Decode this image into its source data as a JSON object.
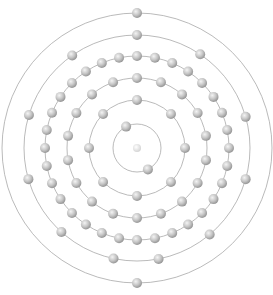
{
  "diagram": {
    "type": "bohr-model",
    "element_configuration": [
      2,
      8,
      18,
      32,
      11,
      2
    ],
    "total_electrons": 73,
    "colors": {
      "background": "#ffffff",
      "orbit": "#a8a8a8",
      "electron_light": "#f4f4f4",
      "electron_mid": "#c4c4c4",
      "electron_dark": "#8e8e8e",
      "nucleus_light": "#ffffff",
      "nucleus_dark": "#cfcfcf"
    },
    "center": {
      "x": 137,
      "y": 148
    },
    "nucleus": {
      "radius": 4
    },
    "electron_radius": 5,
    "shells": [
      {
        "name": "shell-1",
        "radius": 24,
        "electrons": 2,
        "start_angle": -27,
        "angles": null
      },
      {
        "name": "shell-2",
        "radius": 48,
        "electrons": 8,
        "start_angle": 0,
        "angles": null
      },
      {
        "name": "shell-3",
        "radius": 70,
        "electrons": 18,
        "start_angle": 0,
        "angles": null
      },
      {
        "name": "shell-4",
        "radius": 92,
        "electrons": 32,
        "start_angle": 0,
        "angles": null
      },
      {
        "name": "shell-5",
        "radius": 113,
        "electrons": 11,
        "start_angle": 0,
        "angles": [
          0,
          34,
          74,
          106,
          140,
          169,
          192,
          222,
          254,
          287,
          325
        ]
      },
      {
        "name": "shell-6",
        "radius": 135,
        "electrons": 2,
        "start_angle": 0,
        "angles": [
          0,
          180
        ]
      }
    ]
  }
}
